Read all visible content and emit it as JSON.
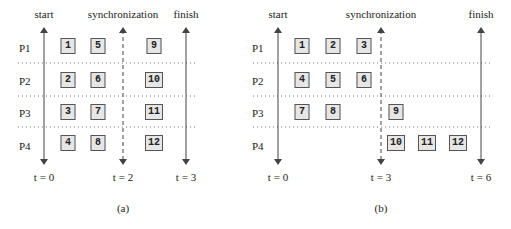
{
  "panels": [
    {
      "caption": "(a)",
      "labels": {
        "start": "start",
        "sync": "synchronization",
        "finish": "finish"
      },
      "processors": [
        "P1",
        "P2",
        "P3",
        "P4"
      ],
      "times": {
        "start": "t = 0",
        "sync": "t = 2",
        "finish": "t = 3"
      },
      "tasks": [
        {
          "id": "1",
          "proc": "P1"
        },
        {
          "id": "5",
          "proc": "P1"
        },
        {
          "id": "9",
          "proc": "P1"
        },
        {
          "id": "2",
          "proc": "P2"
        },
        {
          "id": "6",
          "proc": "P2"
        },
        {
          "id": "10",
          "proc": "P2"
        },
        {
          "id": "3",
          "proc": "P3"
        },
        {
          "id": "7",
          "proc": "P3"
        },
        {
          "id": "11",
          "proc": "P3"
        },
        {
          "id": "4",
          "proc": "P4"
        },
        {
          "id": "8",
          "proc": "P4"
        },
        {
          "id": "12",
          "proc": "P4"
        }
      ]
    },
    {
      "caption": "(b)",
      "labels": {
        "start": "start",
        "sync": "synchronization",
        "finish": "finish"
      },
      "processors": [
        "P1",
        "P2",
        "P3",
        "P4"
      ],
      "times": {
        "start": "t = 0",
        "sync": "t = 3",
        "finish": "t = 6"
      },
      "tasks": [
        {
          "id": "1",
          "proc": "P1"
        },
        {
          "id": "2",
          "proc": "P1"
        },
        {
          "id": "3",
          "proc": "P1"
        },
        {
          "id": "4",
          "proc": "P2"
        },
        {
          "id": "5",
          "proc": "P2"
        },
        {
          "id": "6",
          "proc": "P2"
        },
        {
          "id": "7",
          "proc": "P3"
        },
        {
          "id": "8",
          "proc": "P3"
        },
        {
          "id": "9",
          "proc": "P3"
        },
        {
          "id": "10",
          "proc": "P4"
        },
        {
          "id": "11",
          "proc": "P4"
        },
        {
          "id": "12",
          "proc": "P4"
        }
      ]
    }
  ]
}
